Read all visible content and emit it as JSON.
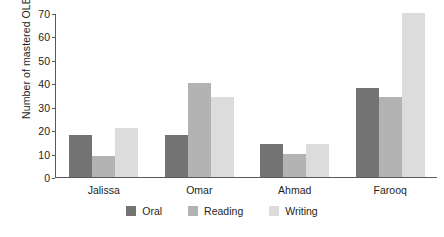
{
  "chart_data": {
    "type": "bar",
    "title": "",
    "subtitle": "",
    "xlabel": "",
    "ylabel": "Number of mastered OLB",
    "categories": [
      "Jalissa",
      "Omar",
      "Ahmad",
      "Farooq"
    ],
    "series": [
      {
        "name": "Oral",
        "color": "#737373",
        "values": [
          18,
          18,
          14,
          38
        ]
      },
      {
        "name": "Reading",
        "color": "#b3b3b3",
        "values": [
          9,
          40,
          10,
          34
        ]
      },
      {
        "name": "Writing",
        "color": "#dcdcdc",
        "values": [
          21,
          34,
          14,
          70
        ]
      }
    ],
    "ylim": [
      0,
      70
    ],
    "ytick_step": 10,
    "yticks": [
      0,
      10,
      20,
      30,
      40,
      50,
      60,
      70
    ],
    "ytick_labels": [
      "0",
      "10",
      "20",
      "30",
      "40",
      "50",
      "60",
      "70"
    ],
    "grid": false,
    "legend_position": "bottom",
    "axis_color": "#58595b",
    "text_color": "#231f20",
    "background": "#ffffff"
  }
}
